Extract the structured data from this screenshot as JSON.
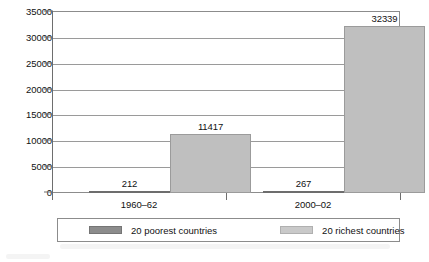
{
  "chart_data": {
    "type": "bar",
    "title": "",
    "subtitle": "",
    "xlabel": "",
    "ylabel": "",
    "categories": [
      "1960–62",
      "2000–02"
    ],
    "ylim": [
      0,
      35000
    ],
    "yticks": [
      0,
      5000,
      10000,
      15000,
      20000,
      25000,
      30000,
      35000
    ],
    "ytick_labels": [
      "0",
      "5000",
      "10000",
      "15000",
      "20000",
      "25000",
      "30000",
      "35000"
    ],
    "grid": true,
    "legend_position": "bottom",
    "series": [
      {
        "name": "20 poorest countries",
        "color": "#8f8f8f",
        "values": [
          212,
          267
        ],
        "value_labels": [
          "212",
          "267"
        ]
      },
      {
        "name": "20 richest countries",
        "color": "#bfbfbf",
        "values": [
          11417,
          32339
        ],
        "value_labels": [
          "11417",
          "32339"
        ]
      }
    ]
  },
  "legend": {
    "entries": [
      {
        "label": "20 poorest countries",
        "swatch": "poorest"
      },
      {
        "label": "20 richest countries",
        "swatch": "richest"
      }
    ]
  },
  "caption": {
    "ghost_text": ""
  }
}
